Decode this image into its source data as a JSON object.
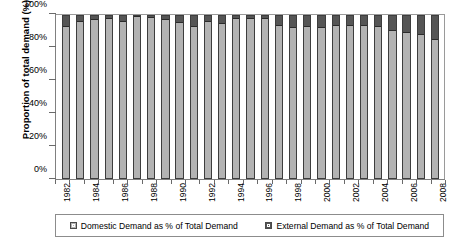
{
  "chart_data": {
    "type": "bar",
    "stacked": true,
    "title": "",
    "xlabel": "",
    "ylabel": "Proportion of total demand (%)",
    "ylim": [
      0,
      100
    ],
    "ytick_labels": [
      "0%",
      "20%",
      "40%",
      "60%",
      "80%",
      "100%"
    ],
    "ytick_values": [
      0,
      20,
      40,
      60,
      80,
      100
    ],
    "grid": false,
    "legend_position": "bottom",
    "categories": [
      "1982",
      "1983",
      "1984",
      "1985",
      "1986",
      "1987",
      "1988",
      "1989",
      "1990",
      "1991",
      "1992",
      "1993",
      "1994",
      "1995",
      "1996",
      "1997",
      "1998",
      "1999",
      "2000",
      "2001",
      "2002",
      "2003",
      "2004",
      "2005",
      "2006",
      "2007",
      "2008"
    ],
    "xtick_labels_shown": [
      "1982",
      "",
      "1984",
      "",
      "1986",
      "",
      "1988",
      "",
      "1990",
      "",
      "1992",
      "",
      "1994",
      "",
      "1996",
      "",
      "1998",
      "",
      "2000",
      "",
      "2002",
      "",
      "2004",
      "",
      "2006",
      "",
      "2008"
    ],
    "series": [
      {
        "name": "Domestic Demand as % of Total Demand",
        "color": "#b3b3b3",
        "values": [
          93.0,
          96.5,
          97.5,
          98.0,
          96.5,
          99.5,
          98.5,
          97.5,
          95.5,
          93.0,
          96.0,
          95.0,
          98.0,
          98.0,
          98.0,
          94.0,
          92.5,
          93.5,
          92.5,
          94.0,
          94.0,
          94.0,
          93.0,
          91.0,
          89.5,
          88.0,
          85.5
        ]
      },
      {
        "name": "External Demand as % of Total Demand",
        "color": "#555555",
        "values": [
          7.0,
          3.5,
          2.5,
          2.0,
          3.5,
          0.5,
          1.5,
          2.5,
          4.5,
          7.0,
          4.0,
          5.0,
          2.0,
          2.0,
          2.0,
          6.0,
          7.5,
          6.5,
          7.5,
          6.0,
          6.0,
          6.0,
          7.0,
          9.0,
          10.5,
          12.0,
          14.5
        ]
      }
    ]
  },
  "legend": {
    "items": [
      {
        "label": "Domestic Demand as % of Total Demand",
        "swatch": "domestic"
      },
      {
        "label": "External Demand as % of Total Demand",
        "swatch": "external"
      }
    ]
  }
}
